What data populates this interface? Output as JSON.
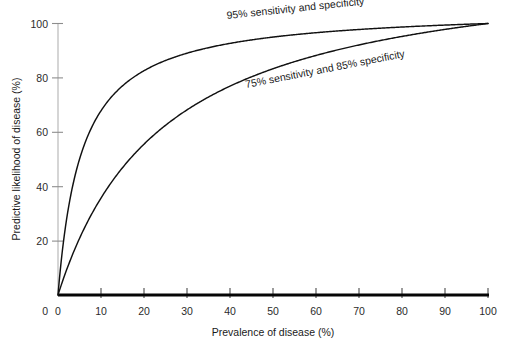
{
  "chart_data": {
    "type": "line",
    "title": "",
    "xlabel": "Prevalence of disease (%)",
    "ylabel": "Predictive likelihood of disease (%)",
    "xlim": [
      0,
      100
    ],
    "ylim": [
      0,
      100
    ],
    "xticks": [
      0,
      10,
      20,
      30,
      40,
      50,
      60,
      70,
      80,
      90,
      100
    ],
    "yticks": [
      0,
      20,
      40,
      60,
      80,
      100
    ],
    "xtick_labels": [
      "0",
      "10",
      "20",
      "30",
      "40",
      "50",
      "60",
      "70",
      "80",
      "90",
      "100"
    ],
    "ytick_labels": [
      "0",
      "20",
      "40",
      "60",
      "80",
      "100"
    ],
    "grid": false,
    "legend_position": "inline-annotations",
    "series": [
      {
        "name": "95% sensitivity and specificity",
        "sensitivity": 95,
        "specificity": 95,
        "color": "#111111",
        "annotation": "95% sensitivity and specificity",
        "x": [
          0,
          1,
          2,
          3,
          5,
          7,
          10,
          15,
          20,
          25,
          30,
          40,
          50,
          60,
          70,
          80,
          90,
          100
        ],
        "values": [
          0,
          16.1,
          27.9,
          37.0,
          50.0,
          58.9,
          67.9,
          77.0,
          82.6,
          86.4,
          89.1,
          92.7,
          95.0,
          96.6,
          97.8,
          98.7,
          99.4,
          100
        ]
      },
      {
        "name": "75% sensitivity and 85% specificity",
        "sensitivity": 75,
        "specificity": 85,
        "color": "#111111",
        "annotation": "75% sensitivity and 85% specificity",
        "x": [
          0,
          1,
          2,
          3,
          5,
          7,
          10,
          15,
          20,
          25,
          30,
          40,
          50,
          60,
          70,
          80,
          90,
          100
        ],
        "values": [
          0,
          4.8,
          9.3,
          13.4,
          20.8,
          27.3,
          35.7,
          46.9,
          55.6,
          62.5,
          68.2,
          76.9,
          83.3,
          88.2,
          92.1,
          95.2,
          97.8,
          100
        ]
      }
    ],
    "annotations": [
      {
        "text": "95% sensitivity and specificity",
        "x_px": 227,
        "y_px": 19,
        "rotation": -6
      },
      {
        "text": "75% sensitivity and 85% specificity",
        "x_px": 246,
        "y_px": 88,
        "rotation": -11
      }
    ],
    "colors": {
      "curve": "#111111",
      "x_axis": "#050505",
      "y_axis": "#b9b9b9",
      "tick_label": "#2b2b2b",
      "background": "#ffffff"
    }
  }
}
